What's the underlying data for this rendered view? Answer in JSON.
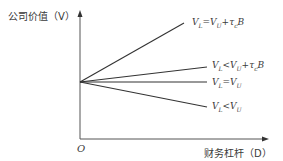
{
  "diagram": {
    "y_axis_label": "公司价值（V）",
    "x_axis_label": "财务杠杆（D）",
    "origin_label": "O",
    "lines": [
      {
        "label": "V_L=V_U+τ_c B",
        "text": "VL=VU+τcB",
        "x1": 80,
        "y1": 82,
        "x2": 184,
        "y2": 23
      },
      {
        "label": "V_L<V_U+τ_c B",
        "text": "VL<VU+τcB",
        "x1": 80,
        "y1": 82,
        "x2": 207,
        "y2": 67
      },
      {
        "label": "V_L=V_U",
        "text": "VL=VU",
        "x1": 80,
        "y1": 82,
        "x2": 207,
        "y2": 82
      },
      {
        "label": "V_L<V_U",
        "text": "VL<VU",
        "x1": 80,
        "y1": 82,
        "x2": 207,
        "y2": 107
      }
    ],
    "line_color": "#333333",
    "axis_color": "#444444"
  }
}
